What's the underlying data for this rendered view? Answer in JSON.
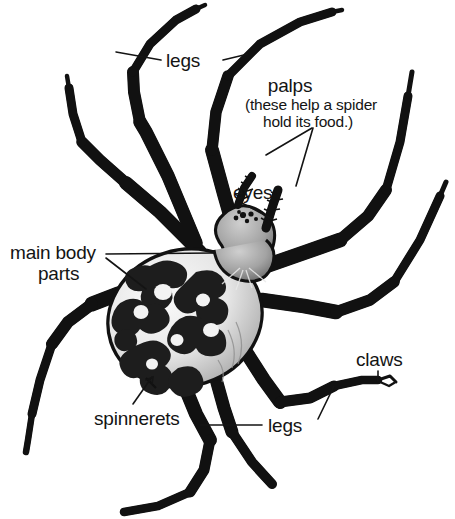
{
  "diagram": {
    "background_color": "#ffffff",
    "ink_color": "#141414",
    "subject": "spider",
    "labels": {
      "legs_top": "legs",
      "legs_bottom": "legs",
      "palps": "palps",
      "palps_note": "(these help a spider",
      "palps_note2": "hold its food.)",
      "eyes": "eyes",
      "main_body_parts_line1": "main body",
      "main_body_parts_line2": "parts",
      "spinnerets": "spinnerets",
      "claws": "claws"
    },
    "parts": [
      {
        "name": "legs",
        "label": "legs",
        "count": 8
      },
      {
        "name": "palps",
        "label": "palps",
        "count": 2
      },
      {
        "name": "eyes",
        "label": "eyes",
        "count": 8
      },
      {
        "name": "main-body-parts",
        "label": "main body parts",
        "count": 2
      },
      {
        "name": "spinnerets",
        "label": "spinnerets",
        "count": 1
      },
      {
        "name": "claws",
        "label": "claws",
        "count": 1
      }
    ],
    "palette": {
      "outline": "#111111",
      "leg_light": "#f2f2f2",
      "leg_mid": "#9a9a9a",
      "leg_dark": "#6a6a6a",
      "body_light": "#ededed",
      "body_mid": "#a9a9a9",
      "pattern_dark": "#1d1d1d"
    }
  }
}
